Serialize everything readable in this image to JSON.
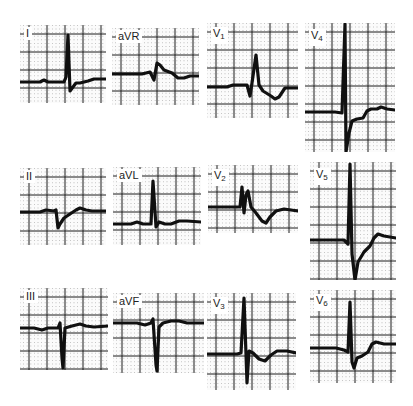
{
  "figure": {
    "background": "#ffffff",
    "grid_color": "#1a1a1a",
    "trace_color": "#111111"
  },
  "leads": [
    {
      "id": "I",
      "label": "I",
      "sub": "",
      "x": 20,
      "y": 25,
      "w": 86,
      "h": 78,
      "baseline": 57,
      "label_x": 4,
      "label_y": 2,
      "trace": "M0,57 L20,57 L24,55 L28,57 L44,57 L46,52 L48,10 L50,66 L53,62 L56,58 L60,58 L68,56 L74,54 L86,54"
    },
    {
      "id": "aVR",
      "label": "aVR",
      "sub": "",
      "x": 112,
      "y": 28,
      "w": 87,
      "h": 77,
      "baseline": 46,
      "label_x": 4,
      "label_y": 2,
      "trace": "M0,46 L30,46 L38,44 L42,52 L45,35 L48,37 L52,42 L60,45 L66,50 L72,50 L78,48 L87,48"
    },
    {
      "id": "V1",
      "label": "V",
      "sub": "1",
      "x": 207,
      "y": 23,
      "w": 91,
      "h": 95,
      "baseline": 64,
      "label_x": 4,
      "label_y": 4,
      "trace": "M0,64 L20,64 L26,62 L40,62 L43,73 L45,60 L49,32 L52,62 L56,68 L64,73 L68,76 L72,74 L78,65 L91,65"
    },
    {
      "id": "V4",
      "label": "V",
      "sub": "4",
      "x": 305,
      "y": 23,
      "w": 90,
      "h": 129,
      "baseline": 90,
      "label_x": 4,
      "label_y": 6,
      "trace": "M0,89 L30,89 L37,90 L40,1 L41,129 L44,110 L47,98 L52,96 L58,95 L62,88 L66,86 L72,86 L76,84 L82,86 L90,87"
    },
    {
      "id": "II",
      "label": "II",
      "sub": "",
      "x": 20,
      "y": 168,
      "w": 86,
      "h": 77,
      "baseline": 44,
      "label_x": 4,
      "label_y": 2,
      "trace": "M0,44 L20,44 L26,42 L34,43 L36,42 L38,60 L40,56 L44,50 L50,46 L56,42 L60,40 L66,42 L72,43 L86,43"
    },
    {
      "id": "aVL",
      "label": "aVL",
      "sub": "",
      "x": 113,
      "y": 167,
      "w": 88,
      "h": 78,
      "baseline": 57,
      "label_x": 4,
      "label_y": 2,
      "trace": "M0,57 L18,57 L24,55 L30,57 L38,57 L40,14 L43,60 L46,55 L52,57 L58,57 L66,54 L74,54 L88,55"
    },
    {
      "id": "V2",
      "label": "V",
      "sub": "2",
      "x": 208,
      "y": 165,
      "w": 90,
      "h": 68,
      "baseline": 42,
      "label_x": 4,
      "label_y": 4,
      "trace": "M0,42 L26,42 L32,42 L34,22 L36,48 L38,30 L40,26 L43,42 L48,48 L54,56 L58,58 L62,52 L68,46 L76,44 L90,46"
    },
    {
      "id": "V5",
      "label": "V",
      "sub": "5",
      "x": 310,
      "y": 162,
      "w": 86,
      "h": 118,
      "baseline": 78,
      "label_x": 4,
      "label_y": 6,
      "trace": "M0,78 L34,78 L38,82 L40,2 L42,92 L45,118 L48,100 L54,90 L60,84 L64,76 L68,72 L74,74 L86,76"
    },
    {
      "id": "III",
      "label": "III",
      "sub": "",
      "x": 20,
      "y": 288,
      "w": 88,
      "h": 82,
      "baseline": 40,
      "label_x": 4,
      "label_y": 2,
      "trace": "M0,40 L14,40 L22,42 L28,40 L38,40 L40,35 L42,70 L43,80 L45,40 L52,38 L60,36 L66,38 L74,39 L88,38"
    },
    {
      "id": "aVF",
      "label": "aVF",
      "sub": "",
      "x": 113,
      "y": 293,
      "w": 91,
      "h": 80,
      "baseline": 30,
      "label_x": 4,
      "label_y": 2,
      "trace": "M0,30 L24,30 L32,32 L38,30 L40,26 L43,72 L44,78 L46,34 L50,30 L58,28 L66,28 L74,30 L91,30"
    },
    {
      "id": "V3",
      "label": "V",
      "sub": "3",
      "x": 207,
      "y": 293,
      "w": 89,
      "h": 97,
      "baseline": 61,
      "label_x": 4,
      "label_y": 4,
      "trace": "M0,61 L30,61 L34,60 L37,5 L40,90 L42,58 L46,60 L52,66 L58,68 L64,62 L70,58 L80,58 L89,60"
    },
    {
      "id": "V6",
      "label": "V",
      "sub": "6",
      "x": 310,
      "y": 290,
      "w": 86,
      "h": 93,
      "baseline": 58,
      "label_x": 4,
      "label_y": 4,
      "trace": "M0,58 L26,58 L34,60 L38,62 L40,12 L42,72 L44,78 L47,68 L52,66 L58,62 L62,54 L66,52 L74,54 L86,54"
    }
  ]
}
